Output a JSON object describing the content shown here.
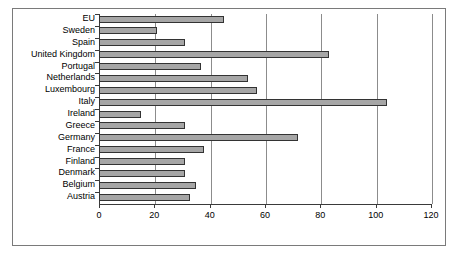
{
  "chart_data": {
    "type": "bar",
    "orientation": "horizontal",
    "title": "",
    "subtitle": "",
    "xlabel": "",
    "ylabel": "",
    "xlim": [
      0,
      120
    ],
    "xticks": [
      0,
      20,
      40,
      60,
      80,
      100,
      120
    ],
    "xtick_labels": [
      "0",
      "20",
      "40",
      "60",
      "80",
      "100",
      "120"
    ],
    "grid": true,
    "grid_axis": "x",
    "legend": false,
    "legend_position": "none",
    "categories": [
      "EU",
      "Sweden",
      "Spain",
      "United Kingdom",
      "Portugal",
      "Netherlands",
      "Luxembourg",
      "Italy",
      "Ireland",
      "Greece",
      "Germany",
      "France",
      "Finland",
      "Denmark",
      "Belgium",
      "Austria"
    ],
    "values": [
      45,
      21,
      31,
      83,
      37,
      54,
      57,
      104,
      15,
      31,
      72,
      38,
      31,
      31,
      35,
      33
    ],
    "bar_color": "#a6a6a6",
    "bar_edge_color": "#333333",
    "gridline_color": "#8c8c8c",
    "axis_color": "#3a3a3a",
    "frame_color": "#7a7a7a",
    "background_color": "#ffffff"
  }
}
